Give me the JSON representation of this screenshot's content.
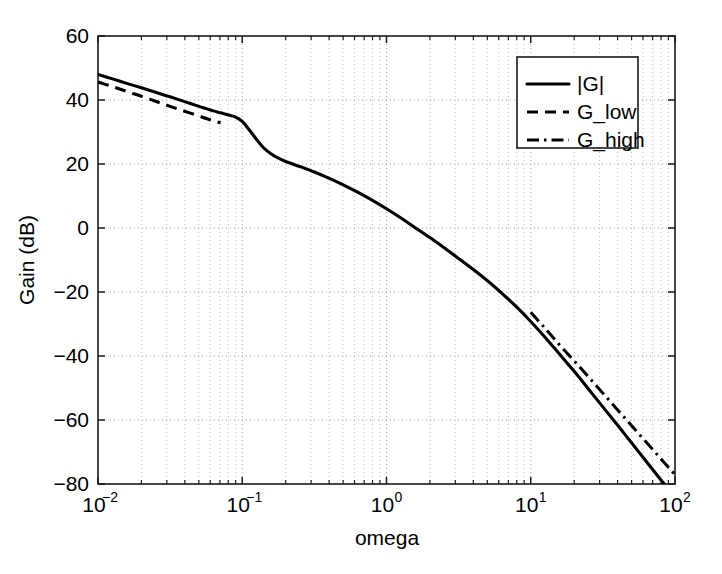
{
  "chart_data": {
    "type": "line",
    "title": "",
    "xlabel": "omega",
    "ylabel": "Gain (dB)",
    "xscale": "log",
    "yscale": "linear",
    "xlim": [
      0.01,
      100
    ],
    "ylim": [
      -80,
      60
    ],
    "grid": true,
    "grid_style": "dotted",
    "legend_position": "upper-right",
    "xticklabels": [
      "10^-2",
      "10^-1",
      "10^0",
      "10^1",
      "10^2"
    ],
    "xtick_base": [
      "10",
      "10",
      "10",
      "10",
      "10"
    ],
    "xtick_exp": [
      "-2",
      "-1",
      "0",
      "1",
      "2"
    ],
    "xticks": [
      0.01,
      0.1,
      1,
      10,
      100
    ],
    "yticks": [
      -80,
      -60,
      -40,
      -20,
      0,
      20,
      40,
      60
    ],
    "yticklabels": [
      "-80",
      "-60",
      "-40",
      "-20",
      "0",
      "20",
      "40",
      "60"
    ],
    "series": [
      {
        "name": "|G|",
        "style": "solid",
        "x": [
          0.01,
          0.0126,
          0.0158,
          0.02,
          0.0251,
          0.0316,
          0.0398,
          0.0501,
          0.0562,
          0.0631,
          0.0708,
          0.0794,
          0.0891,
          0.1,
          0.112,
          0.126,
          0.141,
          0.158,
          0.178,
          0.2,
          0.251,
          0.316,
          0.398,
          0.501,
          0.631,
          0.794,
          1.0,
          1.26,
          1.58,
          2.0,
          2.51,
          3.16,
          3.98,
          5.01,
          6.31,
          7.94,
          10.0,
          12.6,
          15.8,
          20.0,
          25.1,
          31.6,
          39.8,
          50.1,
          63.1,
          79.4,
          100.0
        ],
        "y": [
          48.0,
          46.6,
          45.2,
          43.8,
          42.4,
          41.0,
          39.5,
          38.0,
          37.3,
          36.6,
          36.0,
          35.4,
          34.7,
          33.3,
          30.6,
          27.6,
          25.0,
          23.2,
          21.8,
          20.8,
          19.2,
          17.5,
          15.6,
          13.5,
          11.2,
          8.7,
          6.0,
          3.1,
          0.1,
          -3.0,
          -6.2,
          -9.5,
          -12.9,
          -16.5,
          -20.4,
          -24.6,
          -29.2,
          -34.2,
          -39.4,
          -44.8,
          -50.3,
          -55.9,
          -61.5,
          -67.2,
          -72.9,
          -78.6,
          -84.0
        ]
      },
      {
        "name": "G_low",
        "style": "dashed",
        "x": [
          0.01,
          0.0126,
          0.0158,
          0.02,
          0.0251,
          0.0316,
          0.0398,
          0.0501,
          0.0562,
          0.0631,
          0.0708
        ],
        "y": [
          45.6,
          44.2,
          42.7,
          41.2,
          39.6,
          38.0,
          36.5,
          35.0,
          34.2,
          33.5,
          32.9
        ]
      },
      {
        "name": "G_high",
        "style": "dashdot",
        "x": [
          10.0,
          12.6,
          15.8,
          20.0,
          25.1,
          31.6,
          39.8,
          50.1,
          63.1,
          79.4,
          100.0
        ],
        "y": [
          -26.3,
          -31.4,
          -36.5,
          -41.5,
          -46.5,
          -51.6,
          -56.7,
          -61.8,
          -66.9,
          -72.0,
          -77.1
        ]
      }
    ],
    "legend": [
      {
        "label": "|G|",
        "style": "solid"
      },
      {
        "label": "G_low",
        "style": "dashed"
      },
      {
        "label": "G_high",
        "style": "dashdot"
      }
    ]
  },
  "colors": {
    "background": "#ffffff",
    "axis": "#1a1a1a",
    "curve": "#000000",
    "grid": "#9a9a9a"
  }
}
